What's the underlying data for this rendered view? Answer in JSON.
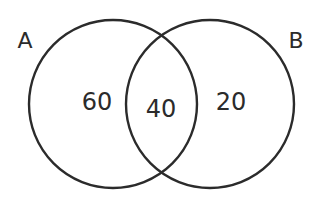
{
  "diagram": {
    "type": "venn",
    "stroke_color": "#2b2b2b",
    "sets": [
      {
        "id": "A",
        "label": "A",
        "cx": 113,
        "cy": 104,
        "r": 84,
        "label_x": 25,
        "label_y": 48
      },
      {
        "id": "B",
        "label": "B",
        "cx": 210,
        "cy": 104,
        "r": 84,
        "label_x": 296,
        "label_y": 48
      }
    ],
    "regions": [
      {
        "id": "A-only",
        "value": "60",
        "x": 97,
        "y": 110
      },
      {
        "id": "A-and-B",
        "value": "40",
        "x": 161,
        "y": 117
      },
      {
        "id": "B-only",
        "value": "20",
        "x": 231,
        "y": 110
      }
    ]
  }
}
